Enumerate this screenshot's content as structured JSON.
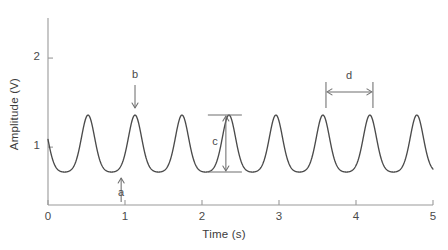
{
  "chart_data": {
    "type": "line",
    "title": "",
    "xlabel": "Time (s)",
    "ylabel": "Amplitude (V)",
    "xlim": [
      0,
      5
    ],
    "ylim": [
      0.35,
      2.45
    ],
    "xticks": [
      0,
      1,
      2,
      3,
      4,
      5
    ],
    "xtick_labels": [
      "0",
      "1",
      "2",
      "3",
      "4",
      "5"
    ],
    "yticks": [
      1,
      2
    ],
    "ytick_labels": [
      "1",
      "2"
    ],
    "grid": false,
    "legend": "none",
    "series": [
      {
        "name": "waveform",
        "color": "#4b4b4b",
        "description": "periodic asymmetric oscillation",
        "baseline": 1.02,
        "peak_value": 1.36,
        "trough_value": 0.72,
        "period": 0.61,
        "phase_offset_s": 0.52,
        "start_value": 1.2,
        "peak_times": [
          0.52,
          1.13,
          1.73,
          2.31,
          2.99,
          3.61,
          4.22,
          4.83
        ],
        "trough_times": [
          0.29,
          0.93,
          1.52,
          2.11,
          2.76,
          3.38,
          3.99,
          4.61
        ]
      }
    ],
    "annotations": [
      {
        "id": "a",
        "label": "a",
        "kind": "arrow-up",
        "points_to": "trough",
        "x": 0.95,
        "y": 0.72,
        "label_x": 0.95,
        "label_y": 0.47,
        "description": "arrow pointing up to a trough (minimum) of the waveform"
      },
      {
        "id": "b",
        "label": "b",
        "kind": "arrow-down",
        "points_to": "peak",
        "x": 1.13,
        "y": 1.36,
        "label_x": 1.13,
        "label_y": 1.8,
        "description": "arrow pointing down to a peak (maximum) of the waveform"
      },
      {
        "id": "c",
        "label": "c",
        "kind": "vertical-double-arrow",
        "measures": "peak-to-trough amplitude",
        "x": 2.31,
        "y_top": 1.36,
        "y_bottom": 0.72,
        "label_x": 2.17,
        "label_y": 1.05,
        "description": "vertical double-headed arrow spanning from trough level to peak level"
      },
      {
        "id": "d",
        "label": "d",
        "kind": "horizontal-double-arrow",
        "measures": "period (peak to peak)",
        "x_left": 3.61,
        "x_right": 4.22,
        "y": 1.62,
        "label_x": 3.91,
        "label_y": 1.79,
        "description": "horizontal double-headed arrow spanning one period between two peaks"
      }
    ]
  },
  "axes": {
    "x_label": "Time (s)",
    "y_label": "Amplitude (V)",
    "x_tick_labels": [
      "0",
      "1",
      "2",
      "3",
      "4",
      "5"
    ],
    "y_tick_labels": [
      "1",
      "2"
    ]
  },
  "annotation_labels": {
    "a": "a",
    "b": "b",
    "c": "c",
    "d": "d"
  },
  "colors": {
    "curve": "#4b4b4b",
    "axis": "#9a9a9a",
    "annotation": "#6e6e6e",
    "text": "#3c3c3c",
    "background": "#ffffff"
  }
}
